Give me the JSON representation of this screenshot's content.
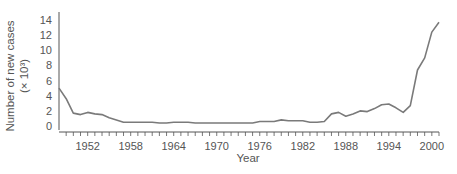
{
  "chart_data": {
    "type": "line",
    "title": "",
    "xlabel": "Year",
    "ylabel": "Number of new cases",
    "ylabel_unit": "(× 10³)",
    "xlim": [
      1948,
      2001
    ],
    "ylim": [
      0,
      14
    ],
    "x_ticks": [
      1952,
      1958,
      1964,
      1970,
      1976,
      1982,
      1988,
      1994,
      2000
    ],
    "y_ticks": [
      0,
      2,
      4,
      6,
      8,
      10,
      12,
      14
    ],
    "grid": false,
    "legend": null,
    "series": [
      {
        "name": "New cases",
        "color": "#7a7a7a",
        "x": [
          1948,
          1949,
          1950,
          1951,
          1952,
          1953,
          1954,
          1955,
          1956,
          1957,
          1958,
          1959,
          1960,
          1961,
          1962,
          1963,
          1964,
          1965,
          1966,
          1967,
          1968,
          1969,
          1970,
          1971,
          1972,
          1973,
          1974,
          1975,
          1976,
          1977,
          1978,
          1979,
          1980,
          1981,
          1982,
          1983,
          1984,
          1985,
          1986,
          1987,
          1988,
          1989,
          1990,
          1991,
          1992,
          1993,
          1994,
          1995,
          1996,
          1997,
          1998,
          1999,
          2000,
          2001
        ],
        "values": [
          5.0,
          3.6,
          1.7,
          1.5,
          1.8,
          1.6,
          1.5,
          1.1,
          0.8,
          0.5,
          0.5,
          0.5,
          0.5,
          0.5,
          0.4,
          0.4,
          0.5,
          0.5,
          0.5,
          0.4,
          0.4,
          0.4,
          0.4,
          0.4,
          0.4,
          0.4,
          0.4,
          0.4,
          0.6,
          0.6,
          0.6,
          0.8,
          0.7,
          0.7,
          0.7,
          0.5,
          0.5,
          0.6,
          1.6,
          1.8,
          1.3,
          1.6,
          2.0,
          1.9,
          2.3,
          2.8,
          2.9,
          2.4,
          1.8,
          2.7,
          7.4,
          9.0,
          12.4,
          13.7
        ]
      }
    ]
  }
}
